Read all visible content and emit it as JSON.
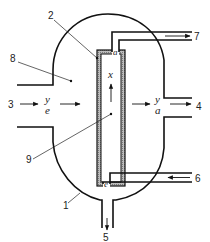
{
  "diagram": {
    "type": "reactor-schematic",
    "stroke_color": "#111111",
    "hatch_color": "#888888",
    "labels": {
      "vessel": "1",
      "membrane_wall": "2",
      "inlet": "3",
      "outlet_side": "4",
      "outlet_bottom": "5",
      "inner_inlet": "6",
      "inner_outlet": "7",
      "outer_chamber": "8",
      "inner_chamber": "9"
    },
    "variables": {
      "inlet_y": "y",
      "inlet_sub": "e",
      "outlet_y": "y",
      "outlet_sub": "a",
      "axial": "x",
      "top_marker": "a",
      "bottom_marker": "e"
    },
    "flows": [
      {
        "id": "3",
        "direction": "right",
        "description": "feed inlet to outer chamber"
      },
      {
        "id": "4",
        "direction": "right",
        "description": "outlet from outer chamber"
      },
      {
        "id": "5",
        "direction": "down",
        "description": "bottom drain"
      },
      {
        "id": "6",
        "direction": "left",
        "description": "inlet to inner tube"
      },
      {
        "id": "7",
        "direction": "right",
        "description": "outlet from inner tube"
      }
    ]
  }
}
